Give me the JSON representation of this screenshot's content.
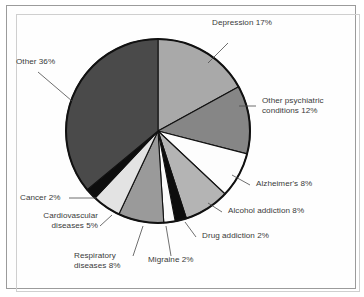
{
  "figure": {
    "background_color": "#ffffff",
    "frame_color": "#9b9b9b",
    "text_color": "#3a3a3a",
    "outline_color": "#111111"
  },
  "chart_data": {
    "type": "pie",
    "title": "",
    "subtitle": "",
    "xlabel": "",
    "ylabel": "",
    "legend_position": "none",
    "grid": false,
    "units": "percent",
    "total": 100,
    "start_angle_deg": 0,
    "direction": "clockwise",
    "categories": [
      "Depression",
      "Other psychiatric conditions",
      "Alzheimer's",
      "Alcohol addiction",
      "Drug addiction",
      "Migraine",
      "Respiratory diseases",
      "Cardiovascular diseases",
      "Cancer",
      "Other"
    ],
    "values": [
      17,
      12,
      8,
      8,
      2,
      2,
      8,
      5,
      2,
      36
    ],
    "colors": [
      "#a9a9a9",
      "#868686",
      "#fdfdfd",
      "#b4b4b4",
      "#0d0d0d",
      "#fbfbfb",
      "#9a9a9a",
      "#e3e3e3",
      "#0d0d0d",
      "#4a4a4a"
    ],
    "slices": [
      {
        "label": "Depression 17%",
        "name": "Depression",
        "value": 17,
        "color": "#a9a9a9"
      },
      {
        "label": "Other psychiatric conditions 12%",
        "name": "Other psychiatric conditions",
        "value": 12,
        "color": "#868686"
      },
      {
        "label": "Alzheimer's 8%",
        "name": "Alzheimer's",
        "value": 8,
        "color": "#fdfdfd"
      },
      {
        "label": "Alcohol addiction 8%",
        "name": "Alcohol addiction",
        "value": 8,
        "color": "#b4b4b4"
      },
      {
        "label": "Drug addiction 2%",
        "name": "Drug addiction",
        "value": 2,
        "color": "#0d0d0d"
      },
      {
        "label": "Migraine 2%",
        "name": "Migraine",
        "value": 2,
        "color": "#fbfbfb"
      },
      {
        "label": "Respiratory diseases 8%",
        "name": "Respiratory diseases",
        "value": 8,
        "color": "#9a9a9a"
      },
      {
        "label": "Cardiovascular diseases 5%",
        "name": "Cardiovascular diseases",
        "value": 5,
        "color": "#e3e3e3"
      },
      {
        "label": "Cancer 2%",
        "name": "Cancer",
        "value": 2,
        "color": "#0d0d0d"
      },
      {
        "label": "Other 36%",
        "name": "Other",
        "value": 36,
        "color": "#4a4a4a"
      }
    ]
  },
  "labels": {
    "depression": "Depression 17%",
    "other_psychiatric_line1": "Other psychiatric",
    "other_psychiatric_line2": "conditions 12%",
    "alzheimers": "Alzheimer's 8%",
    "alcohol_addiction": "Alcohol addiction 8%",
    "drug_addiction": "Drug addiction 2%",
    "migraine": "Migraine 2%",
    "respiratory_line1": "Respiratory",
    "respiratory_line2": "diseases 8%",
    "cardiovascular_line1": "Cardiovascular",
    "cardiovascular_line2": "diseases 5%",
    "cancer": "Cancer 2%",
    "other": "Other 36%"
  }
}
